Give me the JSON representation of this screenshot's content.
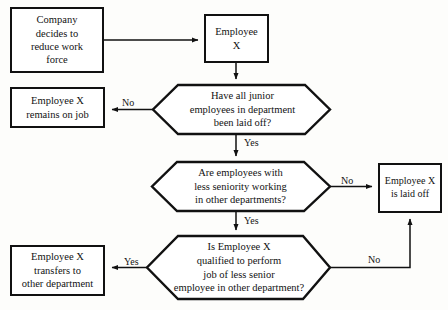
{
  "diagram": {
    "background_color": "#fdfdfb",
    "line_color": "#111111",
    "text_color": "#121212",
    "nodes": {
      "start": {
        "shape": "process",
        "text": "Company\ndecides to\nreduce work\nforce"
      },
      "employee": {
        "shape": "process",
        "text": "Employee\nX"
      },
      "remains": {
        "shape": "process",
        "text": "Employee X\nremains on job"
      },
      "decision1": {
        "shape": "hexagon",
        "text": "Have all junior\nemployees in department\nbeen laid off?"
      },
      "decision2": {
        "shape": "hexagon",
        "text": "Are employees with\nless seniority working\nin other departments?"
      },
      "decision3": {
        "shape": "hexagon",
        "text": "Is Employee X\nqualified to perform\njob of less senior\nemployee in other department?"
      },
      "laidoff": {
        "shape": "process",
        "text": "Employee X\nis laid off"
      },
      "transfers": {
        "shape": "process",
        "text": "Employee X\ntransfers to\nother department"
      }
    },
    "edges": {
      "start_to_employee": {
        "label": ""
      },
      "employee_to_decision1": {
        "label": ""
      },
      "decision1_no": {
        "label": "No"
      },
      "decision1_yes": {
        "label": "Yes"
      },
      "decision2_no": {
        "label": "No"
      },
      "decision2_yes": {
        "label": "Yes"
      },
      "decision3_yes": {
        "label": "Yes"
      },
      "decision3_no": {
        "label": "No"
      }
    }
  }
}
